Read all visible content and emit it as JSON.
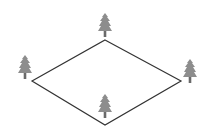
{
  "diagram": {
    "shape": "rhombus",
    "stroke_color": "#333333",
    "tree_color": "#8a8a8a",
    "trunk_color": "#6e6e6e",
    "vertices": {
      "top": [
        105,
        40
      ],
      "right": [
        181,
        81
      ],
      "bottom": [
        105,
        125
      ],
      "left": [
        32,
        81
      ]
    },
    "trees": [
      {
        "position": "top",
        "x": 105,
        "y": 12
      },
      {
        "position": "left",
        "x": 25,
        "y": 54
      },
      {
        "position": "right",
        "x": 190,
        "y": 58
      },
      {
        "position": "bottom",
        "x": 105,
        "y": 93
      }
    ]
  }
}
